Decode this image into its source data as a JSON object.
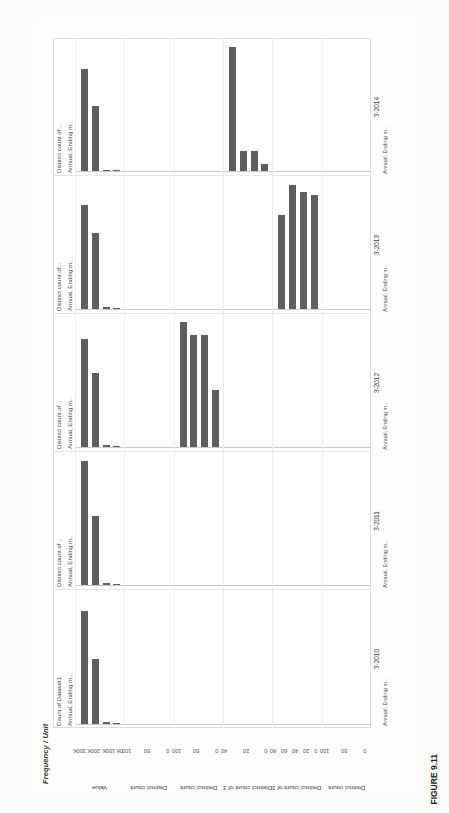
{
  "figure": {
    "caption": "FIGURE 9.11",
    "header_title": "Frequency / Unit"
  },
  "chart_data": {
    "type": "bar",
    "title": "Frequency / Unit",
    "orientation": "horizontal",
    "grid": true,
    "legend": "none",
    "bar_color": "#5e5e5e",
    "column_headers_top": [
      "Count of Dataset1",
      "Distinct count of ..",
      "Distinct count of ..",
      "Distinct count of ..",
      "Distinct count of .."
    ],
    "column_headers_sub": [
      "Annual, Ending m..",
      "Annual, Ending m..",
      "Annual, Ending m..",
      "Annual, Ending m..",
      "Annual, Ending m.."
    ],
    "categories": [
      "3-2010",
      "3-2011",
      "3-2012",
      "3-2013",
      "3-2014"
    ],
    "category_sub": [
      "Annual, Ending m..",
      "Annual, Ending m..",
      "Annual, Ending m..",
      "Annual, Ending m..",
      "Annual, Ending m.."
    ],
    "tiny_tick_labels": [
      "#",
      "N..",
      "T..",
      "#",
      "N..",
      "T..",
      "#",
      "N..",
      "T..",
      "#",
      "N..",
      "T..",
      "#",
      "N..",
      "T.."
    ],
    "rows": [
      {
        "axis_title": "Value",
        "ticks": [
          "0K",
          "100K",
          "200K",
          "300K"
        ],
        "tick_values": [
          0,
          100000,
          200000,
          300000
        ],
        "axis_max": 300000,
        "panels": [
          {
            "category": "3-2010",
            "values": [
              260000,
              150000,
              4000,
              2000
            ]
          },
          {
            "category": "3-2011",
            "values": [
              285000,
              160000,
              4000,
              2000
            ]
          },
          {
            "category": "3-2012",
            "values": [
              250000,
              170000,
              5000,
              2000
            ]
          },
          {
            "category": "3-2013",
            "values": [
              240000,
              175000,
              4000,
              2000
            ]
          },
          {
            "category": "3-2014",
            "values": [
              235000,
              150000,
              3000,
              2000
            ]
          }
        ]
      },
      {
        "axis_title": "Distinct count",
        "ticks": [
          "0",
          "50",
          "100"
        ],
        "tick_values": [
          0,
          50,
          100
        ],
        "axis_max": 100,
        "panels": [
          {
            "category": "3-2010",
            "values": [
              0,
              0,
              0,
              0
            ]
          },
          {
            "category": "3-2011",
            "values": [
              0,
              0,
              0,
              0
            ]
          },
          {
            "category": "3-2012",
            "values": [
              0,
              0,
              0,
              0
            ]
          },
          {
            "category": "3-2013",
            "values": [
              0,
              0,
              0,
              0
            ]
          },
          {
            "category": "3-2014",
            "values": [
              0,
              0,
              0,
              0
            ]
          }
        ]
      },
      {
        "axis_title": "Distinct count",
        "ticks": [
          "0",
          "50",
          "100"
        ],
        "tick_values": [
          0,
          50,
          100
        ],
        "axis_max": 100,
        "panels": [
          {
            "category": "3-2010",
            "values": [
              0,
              0,
              0,
              0
            ]
          },
          {
            "category": "3-2011",
            "values": [
              0,
              0,
              0,
              0
            ]
          },
          {
            "category": "3-2012",
            "values": [
              96,
              86,
              86,
              44
            ]
          },
          {
            "category": "3-2013",
            "values": [
              0,
              0,
              0,
              0
            ]
          },
          {
            "category": "3-2014",
            "values": [
              0,
              0,
              0,
              0
            ]
          }
        ]
      },
      {
        "axis_title": "Distinct count of 3-2019",
        "ticks": [
          "0",
          "20",
          "40"
        ],
        "tick_values": [
          0,
          20,
          40
        ],
        "axis_max": 40,
        "panels": [
          {
            "category": "3-2010",
            "values": [
              0,
              0,
              0,
              0
            ]
          },
          {
            "category": "3-2011",
            "values": [
              0,
              0,
              0,
              0
            ]
          },
          {
            "category": "3-2012",
            "values": [
              0,
              0,
              0,
              0
            ]
          },
          {
            "category": "3-2013",
            "values": [
              0,
              0,
              0,
              0
            ]
          },
          {
            "category": "3-2014",
            "values": [
              38,
              6,
              6,
              2
            ]
          }
        ]
      },
      {
        "axis_title": "Distinct count of 3-2018",
        "ticks": [
          "0",
          "20",
          "40",
          "60",
          "80"
        ],
        "tick_values": [
          0,
          20,
          40,
          60,
          80
        ],
        "axis_max": 80,
        "panels": [
          {
            "category": "3-2010",
            "values": [
              0,
              0,
              0,
              0
            ]
          },
          {
            "category": "3-2011",
            "values": [
              0,
              0,
              0,
              0
            ]
          },
          {
            "category": "3-2012",
            "values": [
              0,
              0,
              0,
              0
            ]
          },
          {
            "category": "3-2013",
            "values": [
              58,
              76,
              72,
              70
            ]
          },
          {
            "category": "3-2014",
            "values": [
              0,
              0,
              0,
              0
            ]
          }
        ]
      },
      {
        "axis_title": "Distinct count",
        "ticks": [
          "0",
          "50",
          "100"
        ],
        "tick_values": [
          0,
          50,
          100
        ],
        "axis_max": 100,
        "panels": [
          {
            "category": "3-2010",
            "values": [
              0,
              0,
              0,
              0
            ]
          },
          {
            "category": "3-2011",
            "values": [
              0,
              0,
              0,
              0
            ]
          },
          {
            "category": "3-2012",
            "values": [
              0,
              0,
              0,
              0
            ]
          },
          {
            "category": "3-2013",
            "values": [
              0,
              0,
              0,
              0
            ]
          },
          {
            "category": "3-2014",
            "values": [
              0,
              0,
              0,
              0
            ]
          }
        ]
      }
    ],
    "extra_row_3_2014_group": {
      "note": "bars in lower-right band",
      "values": [
        38,
        84,
        60,
        58
      ]
    }
  }
}
